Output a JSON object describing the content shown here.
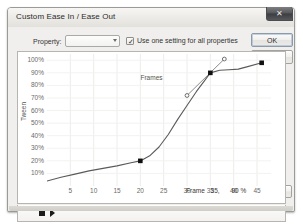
{
  "window": {
    "title": "Custom Ease In / Ease Out",
    "close_icon": "close-icon",
    "close_glyph": "✕"
  },
  "toolbar": {
    "property_label": "Property:",
    "property_value": "",
    "property_placeholder": "",
    "dropdown_icon": "chevron-down-icon",
    "checkbox_label": "Use one setting for all properties",
    "checkbox_checked": true,
    "checkbox_glyph": "✓",
    "ok_label": "OK",
    "cancel_label": "Cancel",
    "reset_label": "Reset"
  },
  "playback": {
    "stop_icon": "stop-icon",
    "play_icon": "play-icon"
  },
  "readout": {
    "label": "Frame",
    "frame": "35,",
    "percent": "90 %"
  },
  "chart_data": {
    "type": "line",
    "title": "",
    "xlabel": "Frames",
    "ylabel": "Tween",
    "xlim": [
      0,
      48
    ],
    "ylim": [
      0,
      105
    ],
    "grid": true,
    "legend": "none",
    "xticks": [
      5,
      10,
      15,
      20,
      25,
      30,
      35,
      40,
      45
    ],
    "xticklabels": [
      "5",
      "10",
      "15",
      "20",
      "25",
      "30",
      "35",
      "40",
      "45"
    ],
    "yticks": [
      10,
      20,
      30,
      40,
      50,
      60,
      70,
      80,
      90,
      100
    ],
    "yticklabels": [
      "10%",
      "20%",
      "30%",
      "40%",
      "50%",
      "60%",
      "70%",
      "80%",
      "90%",
      "100%"
    ],
    "series": [
      {
        "name": "Ease curve",
        "x": [
          0,
          3,
          6,
          9,
          12,
          15,
          18,
          20,
          22,
          24,
          26,
          28,
          30,
          32,
          34,
          35,
          37,
          39,
          41,
          43,
          46
        ],
        "y": [
          4,
          7,
          9.5,
          12,
          14,
          16,
          18.5,
          20,
          24,
          31,
          41,
          53,
          64,
          75,
          85,
          90,
          92,
          92.5,
          93,
          95,
          98
        ]
      }
    ],
    "keyframes": [
      {
        "frame": 20,
        "percent": 20,
        "selected": false
      },
      {
        "frame": 35,
        "percent": 90,
        "selected": true
      },
      {
        "frame": 46,
        "percent": 98,
        "selected": false
      }
    ],
    "tangent_handles": [
      {
        "frame": 30,
        "percent": 72
      },
      {
        "frame": 38,
        "percent": 101
      }
    ]
  }
}
